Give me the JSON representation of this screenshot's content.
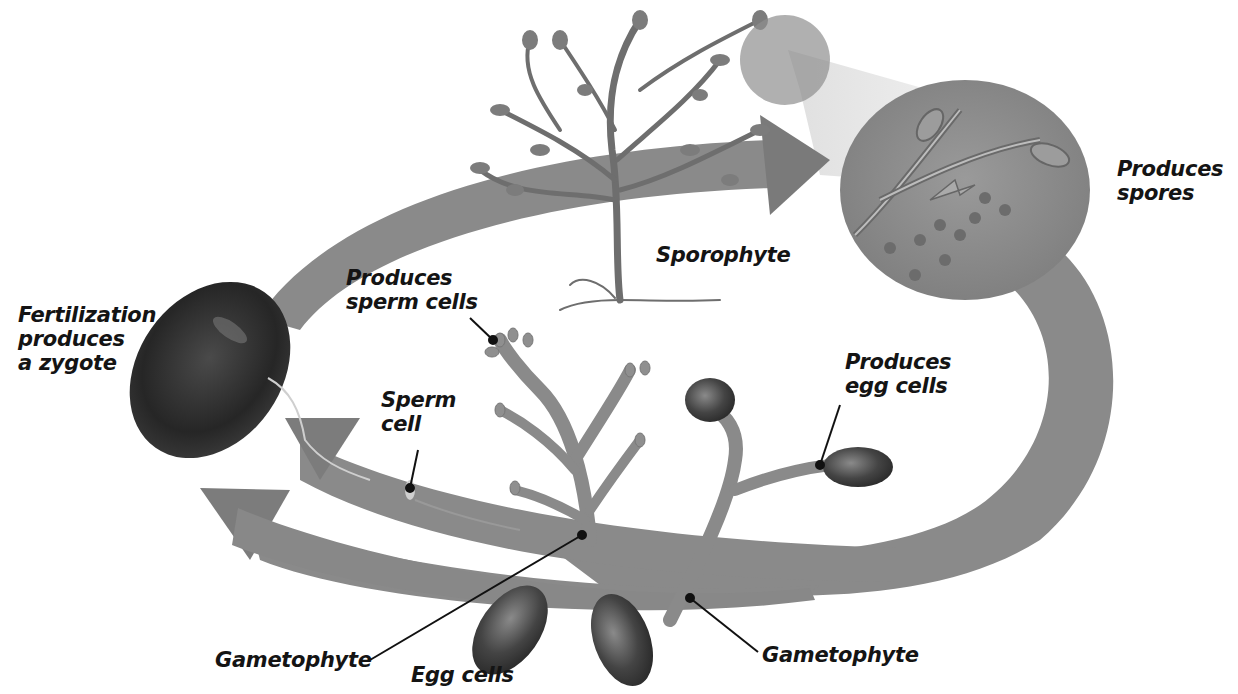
{
  "diagram": {
    "type": "plant life cycle (alternation of generations)",
    "colors": {
      "background": "#ffffff",
      "arrow": "#8a8a8a",
      "arrow_dark": "#6f6f6f",
      "plant": "#7c7c7c",
      "dark_cell": "#2e2e2e",
      "magnifier": "#909090",
      "text": "#141414",
      "leader_line": "#111111"
    },
    "labels": {
      "fertilization": {
        "line1": "Fertilization",
        "line2": "produces",
        "line3": "a zygote"
      },
      "sporophyte": {
        "line1": "Sporophyte"
      },
      "produces_spores": {
        "line1": "Produces",
        "line2": "spores"
      },
      "produces_sperm": {
        "line1": "Produces",
        "line2": "sperm cells"
      },
      "sperm_cell": {
        "line1": "Sperm",
        "line2": "cell"
      },
      "produces_egg": {
        "line1": "Produces",
        "line2": "egg cells"
      },
      "gametophyte_left": {
        "line1": "Gametophyte"
      },
      "egg_cells": {
        "line1": "Egg cells"
      },
      "gametophyte_right": {
        "line1": "Gametophyte"
      }
    },
    "nodes": [
      {
        "id": "zygote",
        "label": "Fertilization produces a zygote"
      },
      {
        "id": "sporophyte",
        "label": "Sporophyte"
      },
      {
        "id": "spores",
        "label": "Produces spores"
      },
      {
        "id": "male-gametophyte",
        "label": "Gametophyte (produces sperm cells)"
      },
      {
        "id": "female-gametophyte",
        "label": "Gametophyte (produces egg cells)"
      },
      {
        "id": "sperm",
        "label": "Sperm cell"
      },
      {
        "id": "eggs",
        "label": "Egg cells"
      }
    ],
    "edges": [
      {
        "from": "zygote",
        "to": "sporophyte"
      },
      {
        "from": "sporophyte",
        "to": "spores"
      },
      {
        "from": "spores",
        "to": "male-gametophyte"
      },
      {
        "from": "spores",
        "to": "female-gametophyte"
      },
      {
        "from": "male-gametophyte",
        "to": "zygote",
        "via": "sperm"
      },
      {
        "from": "female-gametophyte",
        "to": "zygote",
        "via": "eggs"
      }
    ]
  }
}
